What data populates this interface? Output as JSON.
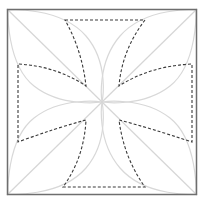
{
  "diagram": {
    "type": "geometric-construction",
    "colors": {
      "background": "#ffffff",
      "outer_square": "#6e6e6e",
      "guide_lines": "#d6d6d6",
      "dashed_shape": "#333333"
    },
    "outer_square": {
      "x": 7,
      "y": 9,
      "width": 190,
      "height": 186
    },
    "diagonals": [
      {
        "x1": 7,
        "y1": 9,
        "x2": 197,
        "y2": 195
      },
      {
        "x1": 197,
        "y1": 9,
        "x2": 7,
        "y2": 195
      }
    ],
    "inner_corners": {
      "top_left": [
        86,
        86
      ],
      "top_right": [
        119,
        86
      ],
      "bottom_left": [
        86,
        120
      ],
      "bottom_right": [
        119,
        120
      ]
    },
    "dashed_cross": {
      "top_edge": {
        "y": 20,
        "x1": 65,
        "x2": 145
      },
      "bottom_edge": {
        "y": 187,
        "x1": 63,
        "x2": 145
      },
      "left_edge": {
        "x": 18,
        "y1": 64,
        "y2": 142
      },
      "right_edge": {
        "x": 192,
        "y1": 64,
        "y2": 142
      }
    }
  }
}
